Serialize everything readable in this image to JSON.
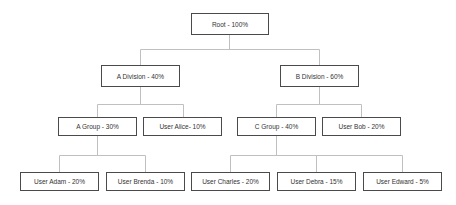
{
  "diagram": {
    "type": "org-tree",
    "colors": {
      "node_border": "#4a4a4a",
      "connector": "#c0c0c0",
      "text": "#333333",
      "background": "#ffffff"
    },
    "nodes": {
      "root": {
        "label": "Root - 100%",
        "parent": null
      },
      "a_division": {
        "label": "A Division - 40%",
        "parent": "root"
      },
      "b_division": {
        "label": "B Division - 60%",
        "parent": "root"
      },
      "a_group": {
        "label": "A Group - 30%",
        "parent": "a_division"
      },
      "user_alice": {
        "label": "User Alice- 10%",
        "parent": "a_division"
      },
      "c_group": {
        "label": "C Group - 40%",
        "parent": "b_division"
      },
      "user_bob": {
        "label": "User Bob - 20%",
        "parent": "b_division"
      },
      "user_adam": {
        "label": "User Adam - 20%",
        "parent": "a_group"
      },
      "user_brenda": {
        "label": "User Brenda - 10%",
        "parent": "a_group"
      },
      "user_charles": {
        "label": "User Charles - 20%",
        "parent": "c_group"
      },
      "user_debra": {
        "label": "User Debra - 15%",
        "parent": "c_group"
      },
      "user_edward": {
        "label": "User Edward - 5%",
        "parent": "c_group"
      }
    }
  }
}
